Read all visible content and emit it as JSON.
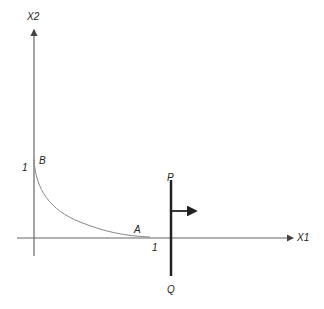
{
  "diagram": {
    "axes": {
      "x_label": "X1",
      "y_label": "X2",
      "x_tick_label": "1",
      "y_tick_label": "1"
    },
    "points": {
      "A": "A",
      "B": "B",
      "P": "P",
      "Q": "Q"
    },
    "elements": [
      {
        "type": "axis",
        "name": "x-axis",
        "label": "X1"
      },
      {
        "type": "axis",
        "name": "y-axis",
        "label": "X2"
      },
      {
        "type": "curve",
        "name": "convex curve from B to A"
      },
      {
        "type": "line",
        "name": "vertical line PQ at x slightly beyond 1"
      },
      {
        "type": "arrow",
        "name": "arrow pointing right from PQ"
      }
    ],
    "colors": {
      "axis": "#555555",
      "curve": "#777777",
      "pq_line": "#222222"
    }
  }
}
